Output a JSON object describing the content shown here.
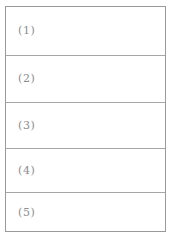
{
  "page": {
    "background_color": "#ffffff",
    "border_color": "#9a9a9a",
    "divider_color": "#a6a6a6",
    "text_color": "#8c8c8c"
  },
  "form": {
    "name": "numbered-blank-rows",
    "rows": [
      {
        "label": "(1)",
        "value": ""
      },
      {
        "label": "(2)",
        "value": ""
      },
      {
        "label": "(3)",
        "value": ""
      },
      {
        "label": "(4)",
        "value": ""
      },
      {
        "label": "(5)",
        "value": ""
      }
    ]
  }
}
